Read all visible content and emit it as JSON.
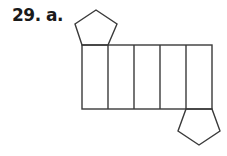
{
  "problem": {
    "label": "29. a."
  },
  "figure": {
    "stroke_color": "#3a3a3a",
    "faces": {
      "pentagons": 2,
      "rectangles": 5
    }
  }
}
